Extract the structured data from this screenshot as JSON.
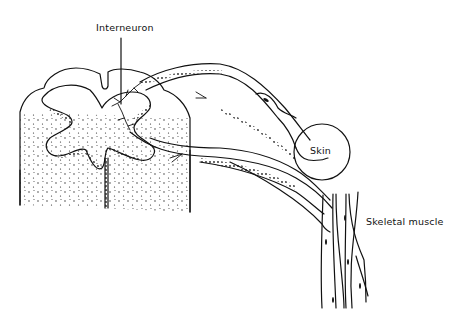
{
  "diagram": {
    "title": "",
    "labels": {
      "interneuron": "Interneuron",
      "skin": "Skin",
      "skeletal_muscle": "Skeletal muscle"
    },
    "colors": {
      "ink": "#111111",
      "background": "#ffffff"
    }
  }
}
